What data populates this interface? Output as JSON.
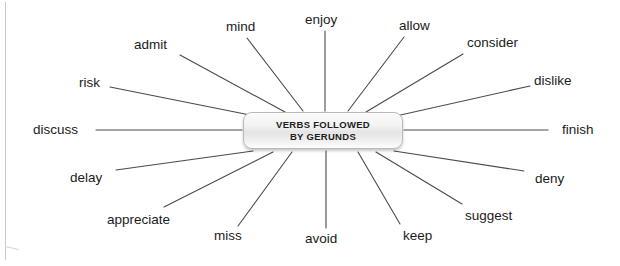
{
  "diagram": {
    "type": "mind-map",
    "title": "VERBS FOLLOWED BY GERUNDS",
    "center": {
      "line1": "VERBS FOLLOWED",
      "line2": "BY GERUNDS"
    },
    "colors": {
      "line": "#4a4a4a",
      "text": "#1b1b1b",
      "node_border": "#b9b9b9",
      "node_fill": "#f0f0f0",
      "background": "#ffffff"
    },
    "verb_count": 16,
    "verbs": [
      {
        "label": "enjoy",
        "lx": 305,
        "ly": 13,
        "x1": 325,
        "y1": 31,
        "x2": 325,
        "y2": 111
      },
      {
        "label": "mind",
        "lx": 226,
        "ly": 20,
        "x1": 247,
        "y1": 38,
        "x2": 303,
        "y2": 111
      },
      {
        "label": "allow",
        "lx": 399,
        "ly": 19,
        "x1": 404,
        "y1": 37,
        "x2": 348,
        "y2": 111
      },
      {
        "label": "admit",
        "lx": 134,
        "ly": 38,
        "x1": 180,
        "y1": 55,
        "x2": 285,
        "y2": 112
      },
      {
        "label": "consider",
        "lx": 467,
        "ly": 36,
        "x1": 463,
        "y1": 54,
        "x2": 366,
        "y2": 112
      },
      {
        "label": "risk",
        "lx": 79,
        "ly": 76,
        "x1": 110,
        "y1": 87,
        "x2": 255,
        "y2": 116
      },
      {
        "label": "dislike",
        "lx": 534,
        "ly": 74,
        "x1": 530,
        "y1": 86,
        "x2": 396,
        "y2": 116
      },
      {
        "label": "discuss",
        "lx": 33,
        "ly": 123,
        "x1": 96,
        "y1": 130,
        "x2": 242,
        "y2": 130
      },
      {
        "label": "finish",
        "lx": 562,
        "ly": 123,
        "x1": 404,
        "y1": 130,
        "x2": 548,
        "y2": 130
      },
      {
        "label": "delay",
        "lx": 70,
        "ly": 171,
        "x1": 116,
        "y1": 170,
        "x2": 253,
        "y2": 151
      },
      {
        "label": "deny",
        "lx": 535,
        "ly": 172,
        "x1": 524,
        "y1": 171,
        "x2": 394,
        "y2": 151
      },
      {
        "label": "appreciate",
        "lx": 107,
        "ly": 213,
        "x1": 164,
        "y1": 207,
        "x2": 273,
        "y2": 152
      },
      {
        "label": "suggest",
        "lx": 465,
        "ly": 209,
        "x1": 462,
        "y1": 204,
        "x2": 376,
        "y2": 152
      },
      {
        "label": "miss",
        "lx": 214,
        "ly": 229,
        "x1": 238,
        "y1": 226,
        "x2": 292,
        "y2": 152
      },
      {
        "label": "keep",
        "lx": 403,
        "ly": 229,
        "x1": 400,
        "y1": 224,
        "x2": 358,
        "y2": 152
      },
      {
        "label": "avoid",
        "lx": 305,
        "ly": 232,
        "x1": 326,
        "y1": 228,
        "x2": 326,
        "y2": 151
      }
    ]
  }
}
